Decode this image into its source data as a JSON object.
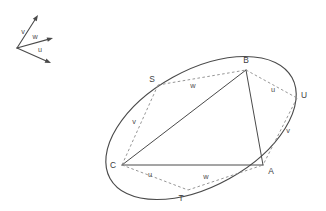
{
  "figure": {
    "background_color": "#ffffff",
    "stroke_color": "#4a4a4a",
    "dashed_color": "#8a8a8a",
    "label_color": "#3d3d3d"
  },
  "legend": {
    "name": "vector-legend",
    "origin": {
      "x": 17,
      "y": 48
    },
    "vectors": [
      {
        "label": "v",
        "name": "vector-v",
        "tip": {
          "x": 38,
          "y": 15
        },
        "label_pos": {
          "x": 23,
          "y": 32
        }
      },
      {
        "label": "w",
        "name": "vector-w",
        "tip": {
          "x": 53,
          "y": 38
        },
        "label_pos": {
          "x": 35,
          "y": 37
        }
      },
      {
        "label": "u",
        "name": "vector-u",
        "tip": {
          "x": 51,
          "y": 63
        },
        "label_pos": {
          "x": 40,
          "y": 50
        }
      }
    ]
  },
  "ellipse": {
    "name": "ellipse-outline",
    "center": {
      "x": 201,
      "y": 128
    },
    "radius_x": 104,
    "radius_y": 58,
    "rotation_deg": -29
  },
  "vertices": [
    {
      "label": "A",
      "name": "vertex-a",
      "x": 263,
      "y": 165,
      "label_pos": {
        "x": 271,
        "y": 172
      }
    },
    {
      "label": "B",
      "name": "vertex-b",
      "x": 246,
      "y": 70,
      "label_pos": {
        "x": 246,
        "y": 61
      }
    },
    {
      "label": "C",
      "name": "vertex-c",
      "x": 122,
      "y": 165,
      "label_pos": {
        "x": 113,
        "y": 166
      }
    },
    {
      "label": "S",
      "name": "point-s",
      "x": 158,
      "y": 85,
      "label_pos": {
        "x": 152,
        "y": 80
      }
    },
    {
      "label": "T",
      "name": "point-t",
      "x": 188,
      "y": 190,
      "label_pos": {
        "x": 181,
        "y": 199
      }
    },
    {
      "label": "U",
      "name": "point-u",
      "x": 297,
      "y": 98,
      "label_pos": {
        "x": 304,
        "y": 96
      }
    }
  ],
  "triangle_edges": [
    {
      "name": "edge-c-b",
      "from": "C",
      "to": "B"
    },
    {
      "name": "edge-b-a",
      "from": "B",
      "to": "A"
    },
    {
      "name": "edge-c-a",
      "from": "C",
      "to": "A"
    }
  ],
  "dashed_edges": [
    {
      "name": "dashed-s-b",
      "from": "S",
      "to": "B",
      "label": "w",
      "label_pos": {
        "x": 193,
        "y": 86
      }
    },
    {
      "name": "dashed-b-u",
      "from": "B",
      "to": "U",
      "label": "u",
      "label_pos": {
        "x": 273,
        "y": 90
      }
    },
    {
      "name": "dashed-u-a",
      "from": "U",
      "to": "A",
      "label": "v",
      "label_pos": {
        "x": 288,
        "y": 131
      }
    },
    {
      "name": "dashed-s-c",
      "from": "S",
      "to": "C",
      "label": "v",
      "label_pos": {
        "x": 134,
        "y": 122
      }
    },
    {
      "name": "dashed-c-t",
      "from": "C",
      "to": "T",
      "label": "u",
      "label_pos": {
        "x": 150,
        "y": 175
      }
    },
    {
      "name": "dashed-t-a",
      "from": "T",
      "to": "A",
      "label": "w",
      "label_pos": {
        "x": 206,
        "y": 177
      }
    }
  ]
}
